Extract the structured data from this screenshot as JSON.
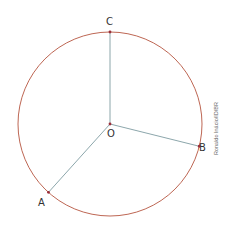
{
  "diagram": {
    "type": "circle-with-radii",
    "colors": {
      "circle": "#b5553f",
      "radius": "#6f8f96",
      "point": "#9b2e3a",
      "label": "#333333"
    },
    "center": {
      "label": "O"
    },
    "points": [
      {
        "id": "C",
        "label": "C",
        "angle_deg": 90
      },
      {
        "id": "B",
        "label": "B",
        "angle_deg": -14
      },
      {
        "id": "A",
        "label": "A",
        "angle_deg": 228
      }
    ],
    "radii": [
      {
        "from": "O",
        "to": "C"
      },
      {
        "from": "O",
        "to": "B"
      },
      {
        "from": "O",
        "to": "A"
      }
    ]
  },
  "credit": "Ronaldo Inácio/ID/BR"
}
